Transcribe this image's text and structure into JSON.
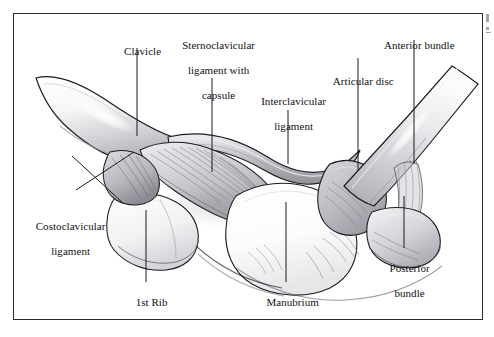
{
  "figure": {
    "frame_color": "#2b2b2f",
    "background_color": "#ffffff",
    "label_color": "#101014",
    "leader_line_color": "#1a1a1e"
  },
  "labels": [
    {
      "id": "clavicle",
      "text": "Clavicle",
      "lines": [
        "Clavicle"
      ],
      "align": "center"
    },
    {
      "id": "sternoclavicular-ligament-with-capsule",
      "text": "Sternoclavicular ligament with capsule",
      "lines": [
        "Sternoclavicular",
        "ligament with",
        "capsule"
      ],
      "align": "center"
    },
    {
      "id": "interclavicular-ligament",
      "text": "Interclavicular ligament",
      "lines": [
        "Interclavicular",
        "ligament"
      ],
      "align": "center"
    },
    {
      "id": "articular-disc",
      "text": "Articular disc",
      "lines": [
        "Articular disc"
      ],
      "align": "center"
    },
    {
      "id": "anterior-bundle",
      "text": "Anterior bundle",
      "lines": [
        "Anterior bundle"
      ],
      "align": "center"
    },
    {
      "id": "posterior-bundle",
      "text": "Posterior bundle",
      "lines": [
        "Posterior",
        "bundle"
      ],
      "align": "center"
    },
    {
      "id": "manubrium",
      "text": "Manubrium",
      "lines": [
        "Manubrium"
      ],
      "align": "center"
    },
    {
      "id": "first-rib",
      "text": "1st Rib",
      "lines": [
        "1st Rib"
      ],
      "align": "center"
    },
    {
      "id": "costoclavicular-ligament",
      "text": "Costoclavicular ligament",
      "lines": [
        "Costoclavicular",
        "ligament"
      ],
      "align": "center"
    }
  ],
  "label_text": {
    "clavicle": "Clavicle",
    "sternoclavicular_l1": "Sternoclavicular",
    "sternoclavicular_l2": "ligament with",
    "sternoclavicular_l3": "capsule",
    "interclavicular_l1": "Interclavicular",
    "interclavicular_l2": "ligament",
    "articular_disc": "Articular disc",
    "anterior_bundle": "Anterior bundle",
    "posterior_l1": "Posterior",
    "posterior_l2": "bundle",
    "manubrium": "Manubrium",
    "first_rib": "1st Rib",
    "costoclavicular_l1": "Costoclavicular",
    "costoclavicular_l2": "ligament"
  },
  "palette": {
    "bone_light": "#fdfdfd",
    "bone_shadow": "#d7d7da",
    "bone_midtone": "#c2c2c6",
    "ligament_light": "#e3e3e6",
    "ligament_mid": "#bfbfc4",
    "ligament_dark": "#8e8e95",
    "outline": "#1c1c20",
    "fiber_stroke": "#7a7a82",
    "disc_fill": "#bdbdc3",
    "highlight": "#ffffff"
  }
}
